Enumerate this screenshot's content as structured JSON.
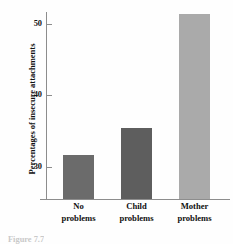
{
  "chart_data": {
    "type": "bar",
    "title": "",
    "xlabel": "",
    "ylabel": "Percentages of insecure attachments",
    "categories": [
      "No problems",
      "Child problems",
      "Mother problems"
    ],
    "category_lines": [
      [
        "No",
        "problems"
      ],
      [
        "Child",
        "problems"
      ],
      [
        "Mother",
        "problems"
      ]
    ],
    "values": [
      31.7,
      35.4,
      51.4
    ],
    "ylim": [
      25.5,
      52.5
    ],
    "yticks": [
      30,
      40,
      50
    ],
    "ytick_labels": [
      "30",
      "40",
      "50"
    ],
    "grid": false,
    "legend": false,
    "bar_colors": [
      "#6b6b6b",
      "#5e5e5e",
      "#aaaaaa"
    ],
    "axis_color": "#8d8d8d"
  },
  "caption": {
    "text": "Figure 7.7"
  }
}
